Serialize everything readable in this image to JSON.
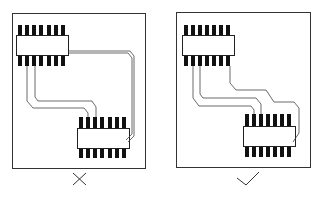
{
  "diagram": {
    "panels": [
      {
        "id": "incorrect",
        "verdict": "incorrect",
        "mark_symbol": "cross",
        "frame": {
          "x": 12,
          "y": 13,
          "w": 133,
          "h": 155
        },
        "chips": [
          {
            "x": 17,
            "y": 35,
            "w": 52,
            "h": 20,
            "pins": 7
          },
          {
            "x": 78,
            "y": 128,
            "w": 52,
            "h": 20,
            "pins": 7
          }
        ]
      },
      {
        "id": "correct",
        "verdict": "correct",
        "mark_symbol": "check",
        "frame": {
          "x": 176,
          "y": 12,
          "w": 134,
          "h": 155
        },
        "chips": [
          {
            "x": 182,
            "y": 35,
            "w": 52,
            "h": 20,
            "pins": 7
          },
          {
            "x": 244,
            "y": 128,
            "w": 52,
            "h": 20,
            "pins": 7
          }
        ]
      }
    ],
    "colors": {
      "ink": "#111111",
      "frame": "#333333",
      "trace": "#444444",
      "background": "#ffffff"
    }
  }
}
